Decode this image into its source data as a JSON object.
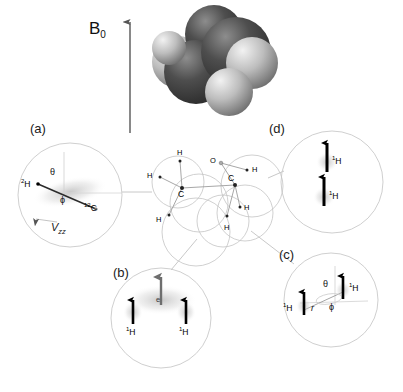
{
  "figure": {
    "field_label": "B",
    "field_subscript": "0",
    "background_color": "#ffffff",
    "line_color": "#b9b9b9",
    "arrow_color": "#000000",
    "electron_arrow_color": "#6e6e6e",
    "carbon_color": "#4a4a4a",
    "hydrogen_color": "#c9c9c9"
  },
  "space_filling_model": {
    "name": "ethanol-space-filling-model",
    "atoms": [
      {
        "label": "C",
        "cx": 232,
        "cy": 52,
        "r": 34,
        "shade": "dark"
      },
      {
        "label": "C",
        "cx": 196,
        "cy": 72,
        "r": 30,
        "shade": "dark"
      },
      {
        "label": "H",
        "cx": 178,
        "cy": 62,
        "r": 25,
        "shade": "light"
      },
      {
        "label": "H",
        "cx": 250,
        "cy": 60,
        "r": 26,
        "shade": "light"
      },
      {
        "label": "H",
        "cx": 228,
        "cy": 92,
        "r": 24,
        "shade": "light"
      },
      {
        "label": "O",
        "cx": 214,
        "cy": 34,
        "r": 28,
        "shade": "dark"
      }
    ]
  },
  "molecule": {
    "name": "ethanol-ball-and-stick",
    "atoms": [
      {
        "id": "c1",
        "label": "C",
        "x": 182,
        "y": 188,
        "label_dx": -2,
        "label_dy": 10
      },
      {
        "id": "c2",
        "label": "C",
        "x": 235,
        "y": 185,
        "label_dx": -5,
        "label_dy": -6
      },
      {
        "id": "h1",
        "label": "H",
        "x": 180,
        "y": 161,
        "label_dx": -3,
        "label_dy": -7
      },
      {
        "id": "h2",
        "label": "H",
        "x": 160,
        "y": 177,
        "label_dx": -12,
        "label_dy": 0
      },
      {
        "id": "h3",
        "label": "H",
        "x": 169,
        "y": 215,
        "label_dx": -12,
        "label_dy": 3
      },
      {
        "id": "h4",
        "label": "H",
        "x": 247,
        "y": 170,
        "label_dx": 5,
        "label_dy": 2
      },
      {
        "id": "h5",
        "label": "H",
        "x": 240,
        "y": 207,
        "label_dx": 4,
        "label_dy": 3
      },
      {
        "id": "h6",
        "label": "H",
        "x": 227,
        "y": 216,
        "label_dx": -3,
        "label_dy": 10
      },
      {
        "id": "o1",
        "label": "O",
        "x": 221,
        "y": 163,
        "label_dx": -11,
        "label_dy": -1
      }
    ]
  },
  "panels": [
    {
      "id": "a",
      "name": "panel-a-quadrupolar",
      "label": "(a)",
      "label_x": 30,
      "label_y": 122,
      "circle": {
        "cx": 70,
        "cy": 195,
        "r": 52
      },
      "annotations": [
        {
          "name": "deuterium-label",
          "text": "²H",
          "x": 25,
          "y": 186
        },
        {
          "name": "carbon12-label",
          "text": "¹²C",
          "x": 88,
          "y": 206
        },
        {
          "name": "theta-label",
          "text": "θ",
          "x": 52,
          "y": 174
        },
        {
          "name": "phi-label",
          "text": "ϕ",
          "x": 62,
          "y": 202
        },
        {
          "name": "vzz-label",
          "text": "V",
          "sub": "zz",
          "x": 52,
          "y": 226
        }
      ]
    },
    {
      "id": "b",
      "name": "panel-b-electron-proton",
      "label": "(b)",
      "label_x": 113,
      "label_y": 266,
      "circle": {
        "cx": 161,
        "cy": 318,
        "r": 50
      },
      "annotations": [
        {
          "name": "electron-label",
          "text": "e",
          "x": 157,
          "y": 300
        },
        {
          "name": "proton-left-label",
          "text": "¹H",
          "x": 128,
          "y": 332
        },
        {
          "name": "proton-right-label",
          "text": "¹H",
          "x": 177,
          "y": 332
        }
      ]
    },
    {
      "id": "c",
      "name": "panel-c-dipolar-geometry",
      "label": "(c)",
      "label_x": 279,
      "label_y": 248,
      "circle": {
        "cx": 331,
        "cy": 300,
        "r": 47
      },
      "annotations": [
        {
          "name": "theta-label",
          "text": "θ",
          "x": 325,
          "y": 286
        },
        {
          "name": "phi-label",
          "text": "ϕ",
          "x": 331,
          "y": 307
        },
        {
          "name": "r-label",
          "text": "r",
          "x": 311,
          "y": 308
        },
        {
          "name": "proton-upper-label",
          "text": "¹H",
          "x": 343,
          "y": 288
        },
        {
          "name": "proton-lower-label",
          "text": "¹H",
          "x": 284,
          "y": 307
        }
      ]
    },
    {
      "id": "d",
      "name": "panel-d-proton-pair",
      "label": "(d)",
      "label_x": 269,
      "label_y": 122,
      "circle": {
        "cx": 332,
        "cy": 182,
        "r": 51
      },
      "annotations": [
        {
          "name": "proton-upper-label",
          "text": "¹H",
          "x": 334,
          "y": 156
        },
        {
          "name": "proton-lower-label",
          "text": "¹H",
          "x": 330,
          "y": 191
        }
      ]
    }
  ],
  "leader_lines": [
    {
      "name": "leader-a",
      "x1": 122,
      "y1": 192,
      "x2": 152,
      "y2": 192
    },
    {
      "name": "leader-d",
      "x1": 268,
      "y1": 178,
      "x2": 285,
      "y2": 172
    },
    {
      "name": "leader-b",
      "x1": 196,
      "y1": 240,
      "x2": 172,
      "y2": 270
    },
    {
      "name": "leader-c",
      "x1": 252,
      "y1": 232,
      "x2": 293,
      "y2": 265
    }
  ],
  "field_arrow": {
    "name": "b0-field-arrow",
    "x": 130,
    "y_top": 16,
    "y_bottom": 133,
    "label_x": 89,
    "label_y": 20
  }
}
